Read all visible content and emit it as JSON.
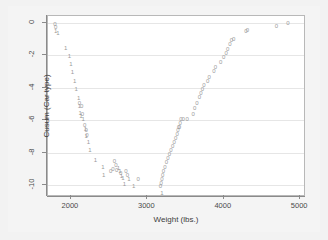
{
  "chart_data": {
    "type": "scatter",
    "title": "",
    "xlabel": "Weight (lbs.)",
    "ylabel": "Cusum (Car type)",
    "xlim": [
      1700,
      5050
    ],
    "ylim": [
      -10.6,
      0.4
    ],
    "xticks": [
      2000,
      3000,
      4000,
      5000
    ],
    "yticks": [
      0,
      -2,
      -4,
      -6,
      -8,
      -10
    ],
    "grid": "horizontal",
    "legend": "none",
    "marker_color": "#9a9a9a",
    "series": [
      {
        "name": "Domestic (1)",
        "marker": "1",
        "points": [
          [
            1800,
            -0.55
          ],
          [
            1830,
            -0.62
          ],
          [
            1930,
            -1.55
          ],
          [
            1980,
            -2.05
          ],
          [
            2000,
            -2.55
          ],
          [
            2020,
            -3.05
          ],
          [
            2050,
            -3.6
          ],
          [
            2070,
            -4.1
          ],
          [
            2100,
            -4.65
          ],
          [
            2110,
            -5.1
          ],
          [
            2120,
            -5.55
          ],
          [
            2130,
            -5.75
          ],
          [
            2160,
            -5.95
          ],
          [
            2190,
            -6.55
          ],
          [
            2200,
            -6.95
          ],
          [
            2230,
            -7.35
          ],
          [
            2250,
            -7.85
          ],
          [
            2320,
            -8.45
          ],
          [
            2420,
            -8.85
          ],
          [
            2430,
            -9.35
          ],
          [
            2620,
            -8.95
          ],
          [
            2640,
            -9.1
          ],
          [
            2660,
            -9.45
          ],
          [
            2680,
            -9.55
          ],
          [
            2700,
            -9.9
          ],
          [
            2760,
            -9.6
          ],
          [
            2820,
            -10.05
          ],
          [
            3190,
            -10.5
          ]
        ]
      },
      {
        "name": "Foreign (0)",
        "marker": "0",
        "points": [
          [
            1790,
            -0.1
          ],
          [
            1800,
            -0.28
          ],
          [
            2110,
            -4.95
          ],
          [
            2140,
            -5.1
          ],
          [
            2150,
            -5.6
          ],
          [
            2180,
            -6.3
          ],
          [
            2200,
            -6.6
          ],
          [
            2210,
            -6.9
          ],
          [
            2570,
            -8.5
          ],
          [
            2590,
            -8.75
          ],
          [
            2600,
            -9.05
          ],
          [
            2520,
            -9.15
          ],
          [
            2550,
            -9.0
          ],
          [
            2650,
            -9.25
          ],
          [
            2720,
            -9.15
          ],
          [
            2740,
            -9.4
          ],
          [
            2880,
            -9.6
          ],
          [
            3170,
            -10.05
          ],
          [
            3180,
            -9.85
          ],
          [
            3190,
            -9.6
          ],
          [
            3200,
            -9.35
          ],
          [
            3210,
            -9.1
          ],
          [
            3230,
            -8.85
          ],
          [
            3250,
            -8.6
          ],
          [
            3270,
            -8.35
          ],
          [
            3290,
            -8.1
          ],
          [
            3310,
            -7.85
          ],
          [
            3330,
            -7.6
          ],
          [
            3350,
            -7.35
          ],
          [
            3370,
            -7.1
          ],
          [
            3390,
            -6.85
          ],
          [
            3400,
            -6.6
          ],
          [
            3410,
            -6.4
          ],
          [
            3420,
            -6.45
          ],
          [
            3430,
            -6.2
          ],
          [
            3440,
            -5.95
          ],
          [
            3470,
            -5.9
          ],
          [
            3520,
            -5.95
          ],
          [
            3600,
            -5.6
          ],
          [
            3620,
            -5.25
          ],
          [
            3650,
            -4.95
          ],
          [
            3680,
            -4.6
          ],
          [
            3700,
            -4.35
          ],
          [
            3720,
            -4.1
          ],
          [
            3740,
            -3.85
          ],
          [
            3790,
            -3.6
          ],
          [
            3810,
            -3.35
          ],
          [
            3870,
            -3.0
          ],
          [
            3890,
            -2.75
          ],
          [
            3960,
            -2.4
          ],
          [
            4000,
            -2.1
          ],
          [
            4030,
            -1.85
          ],
          [
            4050,
            -1.6
          ],
          [
            4080,
            -1.35
          ],
          [
            4100,
            -1.1
          ],
          [
            4130,
            -1.0
          ],
          [
            4290,
            -0.55
          ],
          [
            4310,
            -0.45
          ],
          [
            4690,
            -0.2
          ],
          [
            4840,
            -0.05
          ]
        ]
      }
    ]
  }
}
